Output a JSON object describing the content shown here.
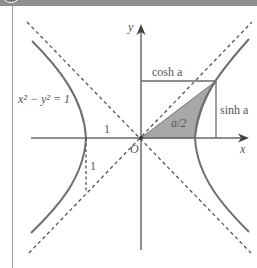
{
  "header": {
    "badge": "!",
    "title": "Did You Know?"
  },
  "diagram": {
    "equation_label": "x² − y² = 1",
    "x_axis_label": "x",
    "y_axis_label": "y",
    "origin_label": "O",
    "unit_label_horizontal": "1",
    "unit_label_vertical": "1",
    "cosh_label": "cosh a",
    "sinh_label": "sinh a",
    "area_label": "a/2",
    "colors": {
      "curve": "#6f6f6f",
      "axes": "#6a6a6a",
      "asymptotes": "#555555",
      "sector_fill": "#a8a8a8",
      "header_bg": "#8f8f8f"
    }
  }
}
